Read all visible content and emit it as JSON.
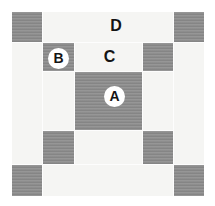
{
  "colors": {
    "page-bg": "#ffffff",
    "patch-dark": "#8c8c8c",
    "patch-light": "#f5f5f3",
    "seam": "#fdfdfd",
    "label-ink": "#141414",
    "label-circle-bg": "#ffffff"
  },
  "quilt_block": {
    "grid": {
      "rows": 5,
      "cols": 5
    },
    "dark_pieces": [
      "corner-tl",
      "corner-tr",
      "inner-tl",
      "inner-tr",
      "center",
      "inner-bl",
      "inner-br",
      "corner-bl",
      "corner-br"
    ],
    "labels": {
      "a": {
        "text": "A",
        "style": "circle"
      },
      "b": {
        "text": "B",
        "style": "circle"
      },
      "c": {
        "text": "C",
        "style": "plain"
      },
      "d": {
        "text": "D",
        "style": "plain"
      }
    }
  }
}
